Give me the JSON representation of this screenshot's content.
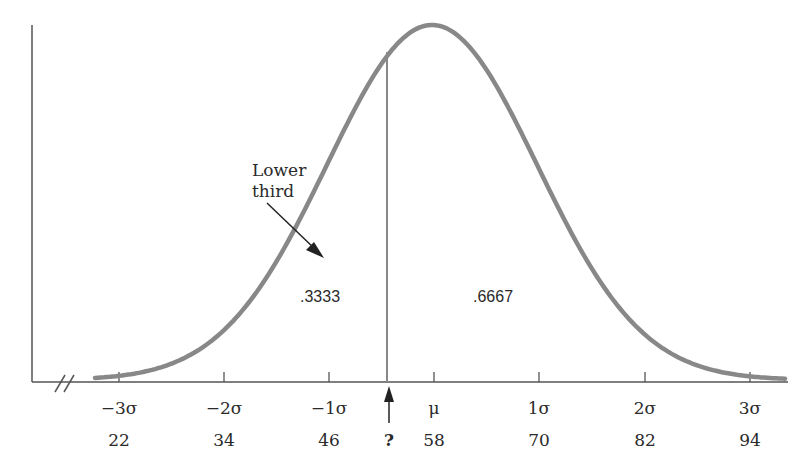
{
  "chart_data": {
    "type": "line",
    "title": "",
    "xlabel": "",
    "ylabel": "",
    "x_ticks_sigma": [
      "−3σ",
      "−2σ",
      "−1σ",
      "μ",
      "1σ",
      "2σ",
      "3σ"
    ],
    "x_ticks_values": [
      "22",
      "34",
      "46",
      "58",
      "70",
      "82",
      "94"
    ],
    "mean": 58,
    "sd": 12,
    "cutoff_label": "?",
    "areas": [
      {
        "label": ".3333",
        "region": "left of cutoff"
      },
      {
        "label": ".6667",
        "region": "right of cutoff"
      }
    ],
    "annotation": {
      "text_line1": "Lower",
      "text_line2": "third"
    },
    "axis_break": true
  }
}
